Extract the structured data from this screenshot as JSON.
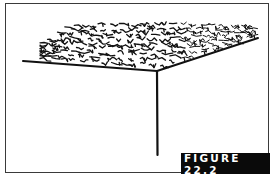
{
  "figure": {
    "label": "FIGURE 22.2",
    "label_bg": "#0a0a0a",
    "label_fg": "#ffffff",
    "ink_color": "#111111",
    "illustration": "grass-field-corner-perspective"
  }
}
